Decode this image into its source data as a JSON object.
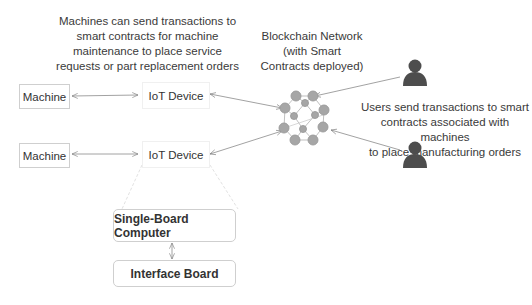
{
  "captions": {
    "machines_note": [
      "Machines can send transactions to",
      "smart contracts for machine",
      "maintenance to place service",
      "requests or part replacement orders"
    ],
    "blockchain_label": [
      "Blockchain Network",
      "(with Smart",
      "Contracts deployed)"
    ],
    "users_note": [
      "Users send transactions to smart",
      "contracts associated with machines",
      "to place manufacturing orders"
    ]
  },
  "nodes": {
    "machine_1": "Machine",
    "machine_2": "Machine",
    "iot_1": "IoT Device",
    "iot_2": "IoT Device",
    "sbc": "Single-Board Computer",
    "interface": "Interface Board"
  },
  "icons": {
    "user": "user-icon",
    "network": "blockchain-network-icon"
  },
  "colors": {
    "node_fill": "#a6a6a6",
    "user_fill": "#4d4d4d",
    "arrow": "#7f7f7f"
  }
}
